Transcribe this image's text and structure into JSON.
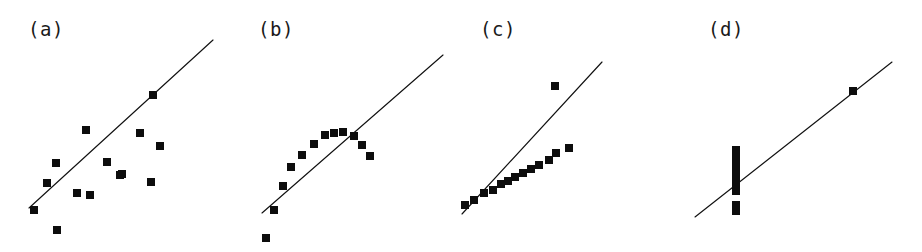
{
  "figure": {
    "background_color": "#ffffff",
    "marker_color": "#0d0d0d",
    "line_color": "#111111",
    "label_color": "#1a1a1a",
    "width": 922,
    "height": 252
  },
  "chart_data": [
    {
      "type": "scatter",
      "title": "(a)",
      "xlabel": "",
      "ylabel": "",
      "xlim": [
        0,
        230
      ],
      "ylim": [
        252,
        0
      ],
      "grid": false,
      "legend": "none",
      "annotations": [
        "linear relationship with scatter about the fitted line"
      ],
      "points": [
        {
          "x": 34,
          "y": 210
        },
        {
          "x": 47,
          "y": 183
        },
        {
          "x": 57,
          "y": 230
        },
        {
          "x": 56,
          "y": 163
        },
        {
          "x": 77,
          "y": 193
        },
        {
          "x": 86,
          "y": 130
        },
        {
          "x": 90,
          "y": 195
        },
        {
          "x": 107,
          "y": 162
        },
        {
          "x": 120,
          "y": 175
        },
        {
          "x": 122,
          "y": 174
        },
        {
          "x": 140,
          "y": 133
        },
        {
          "x": 151,
          "y": 182
        },
        {
          "x": 153,
          "y": 95
        },
        {
          "x": 160,
          "y": 146
        }
      ],
      "fit_line": {
        "x1": 29,
        "y1": 208,
        "x2": 213,
        "y2": 40
      }
    },
    {
      "type": "scatter",
      "title": "(b)",
      "xlabel": "",
      "ylabel": "",
      "xlim": [
        0,
        230
      ],
      "ylim": [
        252,
        0
      ],
      "grid": false,
      "legend": "none",
      "annotations": [
        "curved (quadratic) relationship, straight line is a poor fit"
      ],
      "points": [
        {
          "x": 36,
          "y": 238
        },
        {
          "x": 44,
          "y": 210
        },
        {
          "x": 53,
          "y": 186
        },
        {
          "x": 61,
          "y": 167
        },
        {
          "x": 72,
          "y": 155
        },
        {
          "x": 84,
          "y": 144
        },
        {
          "x": 95,
          "y": 135
        },
        {
          "x": 104,
          "y": 133
        },
        {
          "x": 113,
          "y": 132
        },
        {
          "x": 124,
          "y": 136
        },
        {
          "x": 132,
          "y": 145
        },
        {
          "x": 140,
          "y": 156
        }
      ],
      "fit_line": {
        "x1": 32,
        "y1": 213,
        "x2": 213,
        "y2": 55
      }
    },
    {
      "type": "scatter",
      "title": "(c)",
      "xlabel": "",
      "ylabel": "",
      "xlim": [
        0,
        230
      ],
      "ylim": [
        252,
        0
      ],
      "grid": false,
      "legend": "none",
      "annotations": [
        "tight linear trend with one high outlier pulling the fit"
      ],
      "points": [
        {
          "x": 13,
          "y": 205
        },
        {
          "x": 22,
          "y": 200
        },
        {
          "x": 32,
          "y": 193
        },
        {
          "x": 41,
          "y": 190
        },
        {
          "x": 49,
          "y": 184
        },
        {
          "x": 56,
          "y": 181
        },
        {
          "x": 63,
          "y": 177
        },
        {
          "x": 71,
          "y": 173
        },
        {
          "x": 79,
          "y": 169
        },
        {
          "x": 87,
          "y": 165
        },
        {
          "x": 97,
          "y": 160
        },
        {
          "x": 104,
          "y": 153
        },
        {
          "x": 103,
          "y": 86
        },
        {
          "x": 117,
          "y": 148
        }
      ],
      "fit_line": {
        "x1": 10,
        "y1": 214,
        "x2": 150,
        "y2": 62
      }
    },
    {
      "type": "scatter",
      "title": "(d)",
      "xlabel": "",
      "ylabel": "",
      "xlim": [
        0,
        232
      ],
      "ylim": [
        252,
        0
      ],
      "grid": false,
      "legend": "none",
      "annotations": [
        "all x identical except one far-right leverage point that determines the line"
      ],
      "points": [
        {
          "x": 46,
          "y": 150
        },
        {
          "x": 46,
          "y": 157
        },
        {
          "x": 46,
          "y": 164
        },
        {
          "x": 46,
          "y": 172
        },
        {
          "x": 46,
          "y": 179
        },
        {
          "x": 46,
          "y": 186
        },
        {
          "x": 46,
          "y": 191
        },
        {
          "x": 46,
          "y": 205
        },
        {
          "x": 46,
          "y": 211
        },
        {
          "x": 163,
          "y": 91
        }
      ],
      "fit_line": {
        "x1": 5,
        "y1": 217,
        "x2": 202,
        "y2": 62
      }
    }
  ],
  "panels": [
    {
      "label": "(a)",
      "left": 0,
      "label_x": 28,
      "label_y": 18
    },
    {
      "label": "(b)",
      "left": 230,
      "label_x": 28,
      "label_y": 18
    },
    {
      "label": "(c)",
      "left": 452,
      "label_x": 28,
      "label_y": 18
    },
    {
      "label": "(d)",
      "left": 690,
      "label_x": 18,
      "label_y": 18
    }
  ],
  "marker": {
    "shape": "filled-square",
    "size": 8
  }
}
